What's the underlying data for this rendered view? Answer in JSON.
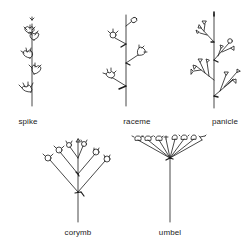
{
  "diagram": {
    "stroke_color": "#1a1a1a",
    "background": "#ffffff",
    "items": [
      {
        "id": "spike",
        "label": "spike",
        "label_x": 28,
        "label_y": 117
      },
      {
        "id": "raceme",
        "label": "raceme",
        "label_x": 137,
        "label_y": 117
      },
      {
        "id": "panicle",
        "label": "panicle",
        "label_x": 225,
        "label_y": 117
      },
      {
        "id": "corymb",
        "label": "corymb",
        "label_x": 78,
        "label_y": 228
      },
      {
        "id": "umbel",
        "label": "umbel",
        "label_x": 170,
        "label_y": 228
      }
    ]
  }
}
